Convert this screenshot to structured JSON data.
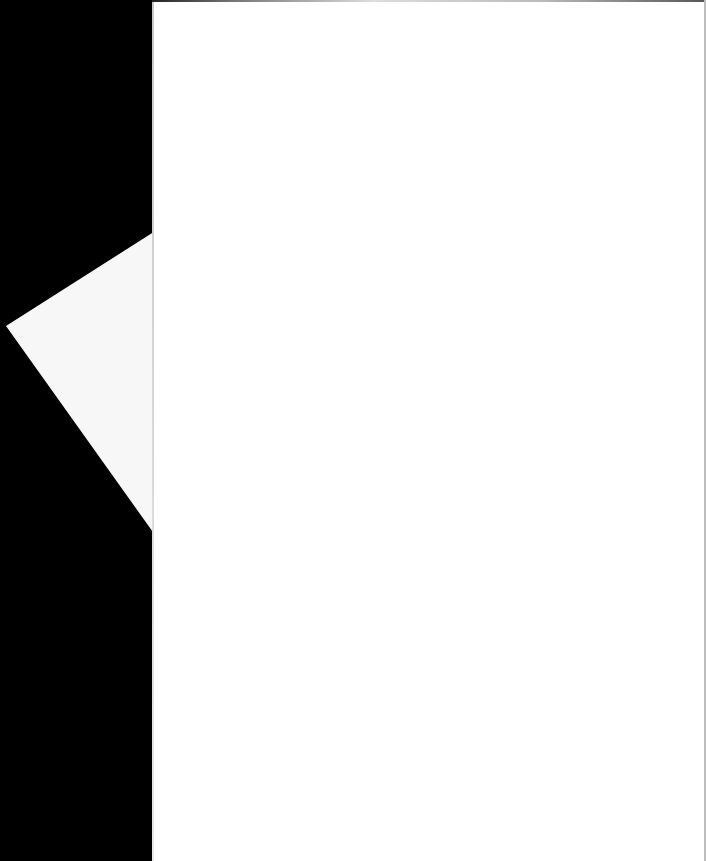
{
  "document": {
    "type": "scanned-page",
    "page_text": "",
    "folded_corner_text": ""
  },
  "colors": {
    "background": "#000000",
    "page": "#ffffff"
  }
}
